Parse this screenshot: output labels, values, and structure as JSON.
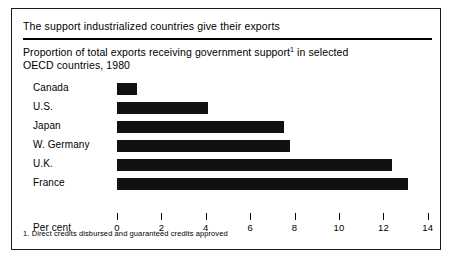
{
  "figure": {
    "title": "The support industrialized countries give their exports",
    "subtitle_line1_pre": "Proportion of total exports receiving government support",
    "subtitle_footnote_marker": "1",
    "subtitle_line1_post": " in selected",
    "subtitle_line2": "OECD countries, 1980",
    "axis_name": "Per cent",
    "footnote": "1. Direct credits disbursed and guaranteed credits approved",
    "bar_color": "#111111",
    "rule_color": "#000000",
    "border_color": "#1a1a1a",
    "background": "#ffffff"
  },
  "chart_data": {
    "type": "bar",
    "orientation": "horizontal",
    "title": "The support industrialized countries give their exports",
    "subtitle": "Proportion of total exports receiving government support¹ in selected OECD countries, 1980",
    "categories": [
      "Canada",
      "U.S.",
      "Japan",
      "W. Germany",
      "U.K.",
      "France"
    ],
    "values": [
      0.9,
      4.1,
      7.5,
      7.8,
      12.4,
      13.1
    ],
    "xlabel": "Per cent",
    "ylabel": "",
    "xlim": [
      0,
      14
    ],
    "xticks": [
      0,
      2,
      4,
      6,
      8,
      10,
      12,
      14
    ],
    "xticklabels": [
      "0",
      "2",
      "4",
      "6",
      "8",
      "10",
      "12",
      "14"
    ],
    "grid": false,
    "legend": false,
    "annotations": [
      "1. Direct credits disbursed and guaranteed credits approved"
    ]
  }
}
